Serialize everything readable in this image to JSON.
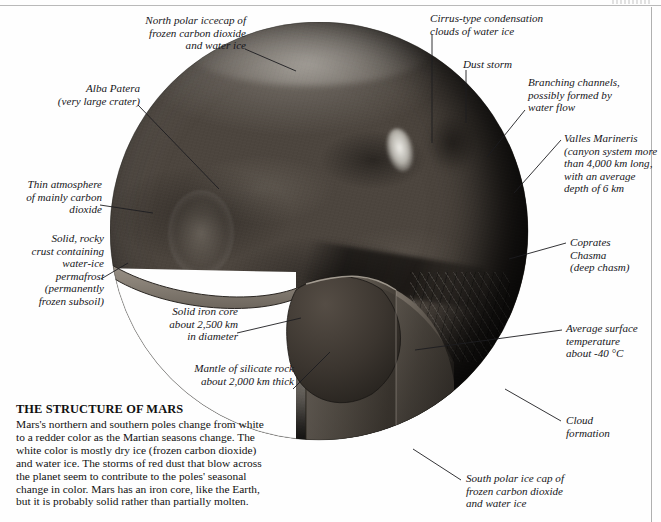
{
  "figure": {
    "title": "THE STRUCTURE OF MARS",
    "body": "Mars's northern and southern poles change from white to a redder color as the Martian seasons change. The white color is mostly dry ice (frozen carbon dioxide) and water ice. The storms of red dust that blow across the planet seem to contribute to the poles' seasonal change in color. Mars has an iron core, like the Earth, but it is probably solid rather than partially molten."
  },
  "labels": {
    "north_polar_icecap": "North polar iccecap of\nfrozen carbon dioxide\nand water ice",
    "alba_patera": "Alba Patera\n(very large crater)",
    "thin_atmosphere": "Thin atmosphere\nof mainly carbon\ndioxide",
    "solid_rocky_crust": "Solid, rocky\ncrust containing\nwater-ice\npermafrost\n(permanently\nfrozen subsoil)",
    "solid_iron_core": "Solid iron core\nabout 2,500 km\nin diameter",
    "mantle": "Mantle of silicate rock\nabout 2,000 km thick",
    "cirrus_clouds": "Cirrus-type condensation\nclouds of water ice",
    "dust_storm": "Dust storm",
    "branching_channels": "Branching channels,\npossibly formed by\nwater flow",
    "valles_marineris": "Valles Marineris\n(canyon system more\nthan 4,000 km long,\nwith an average\ndepth of 6 km",
    "coprates_chasma": "Coprates\nChasma\n(deep chasm)",
    "avg_surface_temp": "Average surface\ntemperature\nabout -40 °C",
    "cloud_formation": "Cloud\nformation",
    "south_polar_ice_cap": "South polar ice cap of\nfrozen carbon dioxide\nand water ice"
  },
  "colors": {
    "paper": "#fefefe",
    "ink": "#16161a",
    "frame_rule": "#b9b9b9",
    "planet_mid": "#4c453e",
    "planet_shadow": "#1b1916",
    "core": "#3a342e",
    "mantle": "#5b544c",
    "crust": "#8d857a",
    "ice_white": "#e9e7e1"
  }
}
